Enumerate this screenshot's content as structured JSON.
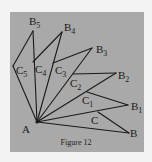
{
  "figure": {
    "caption": "Figure 12",
    "colors": {
      "page": "#f3f3f3",
      "panel": "#a9a9a9",
      "ink": "#1a1a1a"
    },
    "apex": {
      "label": "A",
      "x": 37,
      "y": 122,
      "label_x": 22,
      "label_y": 133
    },
    "outer_points": [
      {
        "label": "B",
        "sub": "",
        "x": 129,
        "y": 133,
        "label_x": 130,
        "label_y": 137
      },
      {
        "label": "B",
        "sub": "1",
        "x": 128,
        "y": 105,
        "label_x": 131,
        "label_y": 110
      },
      {
        "label": "B",
        "sub": "2",
        "x": 116,
        "y": 73,
        "label_x": 118,
        "label_y": 79
      },
      {
        "label": "B",
        "sub": "3",
        "x": 92,
        "y": 48,
        "label_x": 96,
        "label_y": 53
      },
      {
        "label": "B",
        "sub": "4",
        "x": 62,
        "y": 32,
        "label_x": 64,
        "label_y": 31
      },
      {
        "label": "B",
        "sub": "5",
        "x": 33,
        "y": 31,
        "label_x": 29,
        "label_y": 25
      }
    ],
    "inner_points": [
      {
        "label": "C",
        "sub": "",
        "x": 98,
        "y": 112,
        "label_x": 91,
        "label_y": 124
      },
      {
        "label": "C",
        "sub": "1",
        "x": 87,
        "y": 92,
        "label_x": 82,
        "label_y": 104
      },
      {
        "label": "C",
        "sub": "2",
        "x": 73,
        "y": 74,
        "label_x": 70,
        "label_y": 87
      },
      {
        "label": "C",
        "sub": "3",
        "x": 53,
        "y": 63,
        "label_x": 55,
        "label_y": 74
      },
      {
        "label": "C",
        "sub": "4",
        "x": 33,
        "y": 62,
        "label_x": 35,
        "label_y": 73
      },
      {
        "label": "C",
        "sub": "5",
        "x": 13,
        "y": 66,
        "label_x": 16,
        "label_y": 74
      }
    ]
  }
}
